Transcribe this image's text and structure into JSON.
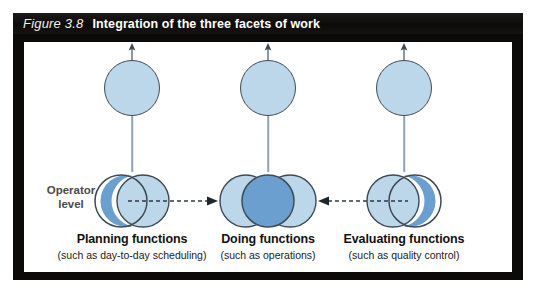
{
  "figure": {
    "number": "Figure 3.8",
    "title": "Integration of the three facets of work"
  },
  "operator_label": {
    "line1": "Operator",
    "line2": "level"
  },
  "columns": [
    {
      "id": "planning",
      "title": "Planning functions",
      "subtitle": "(such as day-to-day scheduling)",
      "top_circle_icon": "circle-node",
      "up_arrow_icon": "arrow-up-icon",
      "cluster_icon": "overlapping-circles-right-crescent"
    },
    {
      "id": "doing",
      "title": "Doing functions",
      "subtitle": "(such as operations)",
      "top_circle_icon": "circle-node",
      "up_arrow_icon": "arrow-up-icon",
      "cluster_icon": "overlapping-circles-triple"
    },
    {
      "id": "evaluating",
      "title": "Evaluating functions",
      "subtitle": "(such as quality control)",
      "top_circle_icon": "circle-node",
      "up_arrow_icon": "arrow-up-icon",
      "cluster_icon": "overlapping-circles-left-crescent"
    }
  ],
  "connectors": [
    {
      "id": "planning-to-doing",
      "style": "dashed",
      "direction": "right",
      "icon": "dashed-arrow-right-icon"
    },
    {
      "id": "evaluating-to-doing",
      "style": "dashed",
      "direction": "left",
      "icon": "dashed-arrow-left-icon"
    }
  ],
  "colors": {
    "header_bar": "#100d0c",
    "frame": "#0c0a09",
    "panel": "#ffffff",
    "circle_light": "#bcd7ea",
    "circle_medium": "#6a9fd0",
    "circle_outline": "#3f4a54",
    "connector_line": "#8fa3b4",
    "operator_text": "#4a4a4a",
    "label_text": "#111111"
  }
}
